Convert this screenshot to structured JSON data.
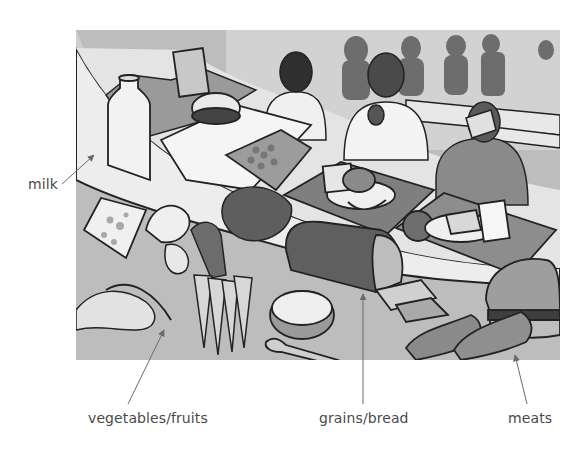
{
  "figure": {
    "style": "grayscale illustration"
  },
  "labels": [
    {
      "id": "milk",
      "text": "milk",
      "points_to": "milk bottle and cheese"
    },
    {
      "id": "vegetables_fruits",
      "text": "vegetables/fruits",
      "points_to": "banana, broccoli, carrots, apple slices"
    },
    {
      "id": "grains_bread",
      "text": "grains/bread",
      "points_to": "loaf of bread and slices"
    },
    {
      "id": "meats",
      "text": "meats",
      "points_to": "chicken drumsticks and hamburger"
    }
  ],
  "colors": {
    "label_text": "#4a4a4a",
    "callout_line": "#6a6a6a",
    "background": "#ffffff"
  }
}
